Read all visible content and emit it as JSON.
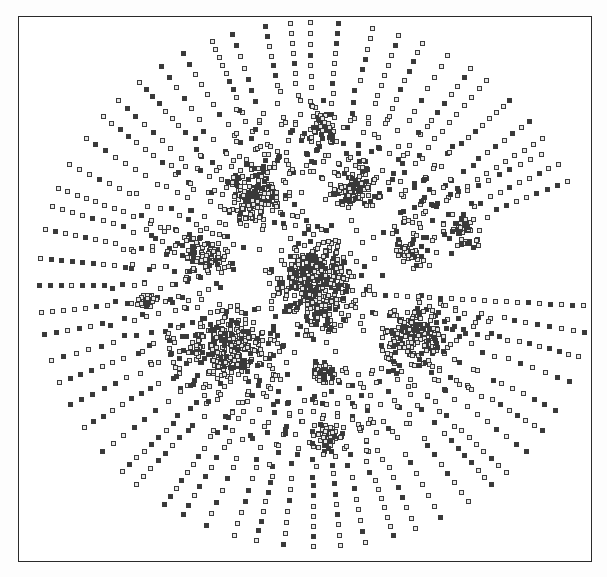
{
  "figure": {
    "type": "network-graph",
    "frame": {
      "x": 18,
      "y": 16,
      "width": 574,
      "height": 546,
      "border_color": "#2a2a2a"
    },
    "center": {
      "x": 312,
      "y": 282
    },
    "node": {
      "shape": "square",
      "size": 4,
      "stroke": "#3a3a3a",
      "fill_light": "#e8e8e8",
      "fill_dark": "#3a3a3a"
    },
    "clusters": [
      {
        "name": "center",
        "x": 312,
        "y": 282,
        "rx": 38,
        "ry": 44,
        "count": 420
      },
      {
        "name": "upper-left",
        "x": 253,
        "y": 195,
        "rx": 30,
        "ry": 30,
        "count": 170
      },
      {
        "name": "upper-center",
        "x": 350,
        "y": 185,
        "rx": 22,
        "ry": 18,
        "count": 90
      },
      {
        "name": "upper-mid",
        "x": 322,
        "y": 125,
        "rx": 15,
        "ry": 15,
        "count": 45
      },
      {
        "name": "left",
        "x": 205,
        "y": 255,
        "rx": 22,
        "ry": 22,
        "count": 80
      },
      {
        "name": "lower-left",
        "x": 230,
        "y": 345,
        "rx": 45,
        "ry": 30,
        "count": 260
      },
      {
        "name": "right",
        "x": 410,
        "y": 330,
        "rx": 30,
        "ry": 25,
        "count": 170
      },
      {
        "name": "right-upper",
        "x": 410,
        "y": 250,
        "rx": 14,
        "ry": 14,
        "count": 40
      },
      {
        "name": "right-far",
        "x": 460,
        "y": 232,
        "rx": 14,
        "ry": 18,
        "count": 40
      },
      {
        "name": "lower-center",
        "x": 325,
        "y": 370,
        "rx": 14,
        "ry": 10,
        "count": 40
      },
      {
        "name": "lower-2",
        "x": 325,
        "y": 435,
        "rx": 14,
        "ry": 12,
        "count": 40
      },
      {
        "name": "left-small",
        "x": 145,
        "y": 298,
        "rx": 7,
        "ry": 7,
        "count": 25
      }
    ],
    "rays": {
      "count": 64,
      "inner_radius": 95,
      "outer_radius_x": 275,
      "outer_radius_y": 262,
      "gap_angles_deg": [
        [
          -20,
          8
        ]
      ],
      "nodes_per_ray": 14
    }
  }
}
